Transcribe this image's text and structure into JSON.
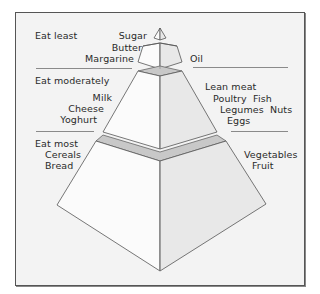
{
  "diagram": {
    "type": "food-pyramid",
    "tiers": [
      {
        "name": "top",
        "heading": "Eat least",
        "left_items": [
          "Sugar",
          "Butter",
          "Margarine"
        ],
        "right_items": [
          "Oil"
        ]
      },
      {
        "name": "middle",
        "heading": "Eat moderately",
        "left_items": [
          "Milk",
          "Cheese",
          "Yoghurt"
        ],
        "right_items": [
          "Lean meat",
          "Poultry  Fish",
          "Legumes  Nuts",
          "Eggs"
        ]
      },
      {
        "name": "bottom",
        "heading": "Eat most",
        "left_items": [
          "Cereals",
          "Bread"
        ],
        "right_items": [
          "Vegetables",
          "Fruit"
        ]
      }
    ],
    "colors": {
      "background": "#f3f3f3",
      "frame_border": "#555555",
      "face_light": "#fbfbfb",
      "face_shade": "#e8e8e8",
      "band": "#c8c8c8",
      "edge": "#555555",
      "divider": "#8a8a8a"
    }
  }
}
